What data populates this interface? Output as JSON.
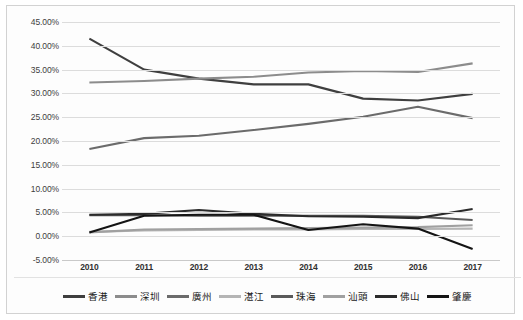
{
  "chart_data": {
    "type": "line",
    "title": "",
    "xlabel": "",
    "ylabel": "",
    "x": [
      "2010",
      "2011",
      "2012",
      "2013",
      "2014",
      "2015",
      "2016",
      "2017"
    ],
    "ylim": [
      -5,
      45
    ],
    "ytick_step": 5,
    "ytick_labels": [
      "45.00%",
      "40.00%",
      "35.00%",
      "30.00%",
      "25.00%",
      "20.00%",
      "15.00%",
      "10.00%",
      "5.00%",
      "0.00%",
      "-5.00%"
    ],
    "ytick_values": [
      45,
      40,
      35,
      30,
      25,
      20,
      15,
      10,
      5,
      0,
      -5
    ],
    "grid": true,
    "legend_position": "bottom",
    "series": [
      {
        "name": "香港",
        "color": "#3f3f3f",
        "values": [
          41.5,
          35.0,
          33.1,
          31.9,
          31.9,
          28.9,
          28.5,
          29.9
        ]
      },
      {
        "name": "深圳",
        "color": "#8c8c8c",
        "values": [
          32.3,
          32.6,
          33.1,
          33.5,
          34.4,
          34.7,
          34.5,
          36.3
        ]
      },
      {
        "name": "廣州",
        "color": "#6b6b6b",
        "values": [
          18.3,
          20.6,
          21.1,
          22.3,
          23.6,
          25.1,
          27.2,
          24.8
        ]
      },
      {
        "name": "湛江",
        "color": "#b5b5b5",
        "values": [
          0.9,
          1.2,
          1.3,
          1.4,
          1.4,
          1.5,
          1.5,
          1.6
        ]
      },
      {
        "name": "珠海",
        "color": "#5a5a5a",
        "values": [
          4.4,
          4.4,
          4.3,
          4.3,
          4.3,
          4.3,
          4.1,
          3.4
        ]
      },
      {
        "name": "汕頭",
        "color": "#a0a0a0",
        "values": [
          0.8,
          1.4,
          1.5,
          1.6,
          1.7,
          1.8,
          1.9,
          2.3
        ]
      },
      {
        "name": "佛山",
        "color": "#2b2b2b",
        "values": [
          4.5,
          4.7,
          5.5,
          4.7,
          4.2,
          4.1,
          3.8,
          5.7
        ]
      },
      {
        "name": "肇慶",
        "color": "#141414",
        "values": [
          0.8,
          4.3,
          4.5,
          4.5,
          1.3,
          2.5,
          1.6,
          -2.7
        ]
      }
    ]
  }
}
